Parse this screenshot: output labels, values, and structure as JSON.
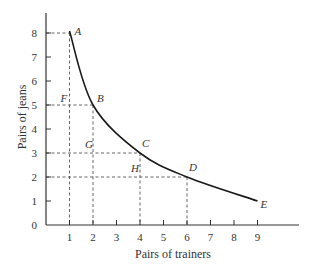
{
  "chart_data": {
    "type": "line",
    "title": "",
    "xlabel": "Pairs of trainers",
    "ylabel": "Pairs of jeans",
    "xlim": [
      0,
      10
    ],
    "ylim": [
      0,
      8.8
    ],
    "x_ticks": [
      1,
      2,
      3,
      4,
      5,
      6,
      7,
      8,
      9
    ],
    "y_ticks": [
      0,
      1,
      2,
      3,
      4,
      5,
      6,
      7,
      8
    ],
    "grid": false,
    "legend": null,
    "series": [
      {
        "name": "indifference curve",
        "x": [
          1,
          2,
          4,
          6,
          9
        ],
        "y": [
          8,
          5,
          3,
          2,
          1
        ],
        "style": "solid smooth curve"
      }
    ],
    "points": [
      {
        "label": "A",
        "x": 1,
        "y": 8
      },
      {
        "label": "B",
        "x": 2,
        "y": 5
      },
      {
        "label": "C",
        "x": 4,
        "y": 3
      },
      {
        "label": "D",
        "x": 6,
        "y": 2
      },
      {
        "label": "E",
        "x": 9,
        "y": 1
      }
    ],
    "annotations": [
      {
        "label": "F",
        "x": 1,
        "y": 5
      },
      {
        "label": "G",
        "x": 2,
        "y": 3
      },
      {
        "label": "H",
        "x": 4,
        "y": 2
      }
    ],
    "guide_lines": [
      {
        "type": "dashed",
        "from": [
          0,
          8
        ],
        "to": [
          1,
          8
        ]
      },
      {
        "type": "dashed",
        "from": [
          1,
          8
        ],
        "to": [
          1,
          0
        ]
      },
      {
        "type": "dashed",
        "from": [
          0,
          5
        ],
        "to": [
          2,
          5
        ]
      },
      {
        "type": "dashed",
        "from": [
          2,
          5
        ],
        "to": [
          2,
          0
        ]
      },
      {
        "type": "dashed",
        "from": [
          0,
          3
        ],
        "to": [
          4,
          3
        ]
      },
      {
        "type": "dashed",
        "from": [
          4,
          3
        ],
        "to": [
          4,
          0
        ]
      },
      {
        "type": "dashed",
        "from": [
          0,
          2
        ],
        "to": [
          6,
          2
        ]
      },
      {
        "type": "dashed",
        "from": [
          6,
          2
        ],
        "to": [
          6,
          0
        ]
      }
    ]
  },
  "colors": {
    "curve": "#1a1a1a",
    "axis": "#333333",
    "guide": "#555555",
    "text": "#333333"
  }
}
